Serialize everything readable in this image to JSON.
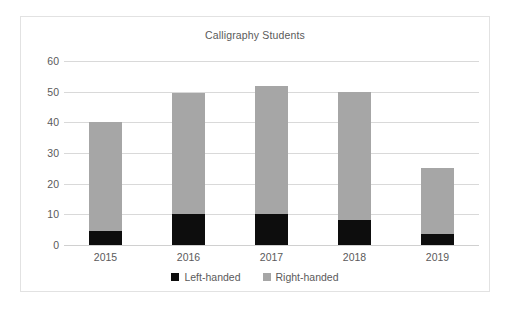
{
  "chart_data": {
    "type": "bar",
    "subtype": "stacked-column",
    "title": "Calligraphy Students",
    "xlabel": "",
    "ylabel": "",
    "categories": [
      "2015",
      "2016",
      "2017",
      "2018",
      "2019"
    ],
    "series": [
      {
        "name": "Left-handed",
        "color": "#0d0d0d",
        "values": [
          4.5,
          10,
          10,
          8,
          3.5
        ]
      },
      {
        "name": "Right-handed",
        "color": "#a6a6a6",
        "values": [
          35.5,
          39.5,
          42,
          42,
          21.5
        ]
      }
    ],
    "totals": [
      40,
      49.5,
      52,
      50,
      25
    ],
    "ylim": [
      0,
      60
    ],
    "yticks": [
      0,
      10,
      20,
      30,
      40,
      50,
      60
    ],
    "ytick_labels": [
      "0",
      "10",
      "20",
      "30",
      "40",
      "50",
      "60"
    ],
    "grid": true,
    "legend_position": "bottom",
    "legend": [
      "Left-handed",
      "Right-handed"
    ]
  },
  "colors": {
    "left_handed": "#0d0d0d",
    "right_handed": "#a6a6a6",
    "gridline": "#d9d9d9",
    "text": "#5a5a5a",
    "border": "#e2e2e2",
    "background": "#ffffff"
  }
}
